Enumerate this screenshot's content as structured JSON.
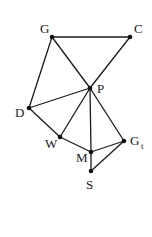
{
  "diagram": {
    "type": "graph",
    "nodes": [
      {
        "id": "G",
        "label": "G",
        "x": 52,
        "y": 37
      },
      {
        "id": "C",
        "label": "C",
        "x": 130,
        "y": 37
      },
      {
        "id": "P",
        "label": "P",
        "x": 90,
        "y": 88
      },
      {
        "id": "D",
        "label": "D",
        "x": 29,
        "y": 108
      },
      {
        "id": "W",
        "label": "W",
        "x": 60,
        "y": 137
      },
      {
        "id": "M",
        "label": "M",
        "x": 91,
        "y": 152
      },
      {
        "id": "Gt",
        "label": "G",
        "subscript": "t",
        "x": 124,
        "y": 141
      },
      {
        "id": "S",
        "label": "S",
        "x": 91,
        "y": 171
      }
    ],
    "edges": [
      [
        "G",
        "C"
      ],
      [
        "G",
        "P"
      ],
      [
        "C",
        "P"
      ],
      [
        "G",
        "D"
      ],
      [
        "D",
        "P"
      ],
      [
        "D",
        "W"
      ],
      [
        "W",
        "P"
      ],
      [
        "P",
        "M"
      ],
      [
        "P",
        "Gt"
      ],
      [
        "W",
        "M"
      ],
      [
        "M",
        "Gt"
      ],
      [
        "M",
        "S"
      ],
      [
        "S",
        "Gt"
      ]
    ]
  }
}
